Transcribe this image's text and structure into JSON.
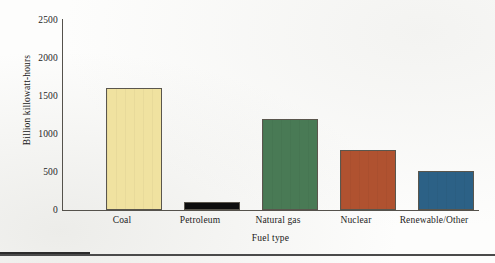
{
  "chart_data": {
    "type": "bar",
    "title": "",
    "xlabel": "Fuel type",
    "ylabel": "Billion killowatt-hours",
    "categories": [
      "Coal",
      "Petroleum",
      "Natural gas",
      "Nuclear",
      "Renewable/Other"
    ],
    "values": [
      1600,
      110,
      1200,
      790,
      510
    ],
    "series": [
      {
        "name": "Electricity generation",
        "values": [
          1600,
          110,
          1200,
          790,
          510
        ]
      }
    ],
    "ylim": [
      0,
      2500
    ],
    "ytick_labels": [
      "2500",
      "2000",
      "1500",
      "1000",
      "500",
      "0"
    ],
    "ytick_values": [
      2500,
      2000,
      1500,
      1000,
      500,
      0
    ],
    "grid": false,
    "legend": false,
    "legend_position": "none",
    "bar_colors": [
      "#F0E2A0",
      "#0D0D0D",
      "#497A55",
      "#B05230",
      "#2C6186"
    ],
    "bar_outline_color": "#5A564D",
    "axis_color": "#55524C",
    "background_color": "#FDFDFC"
  }
}
